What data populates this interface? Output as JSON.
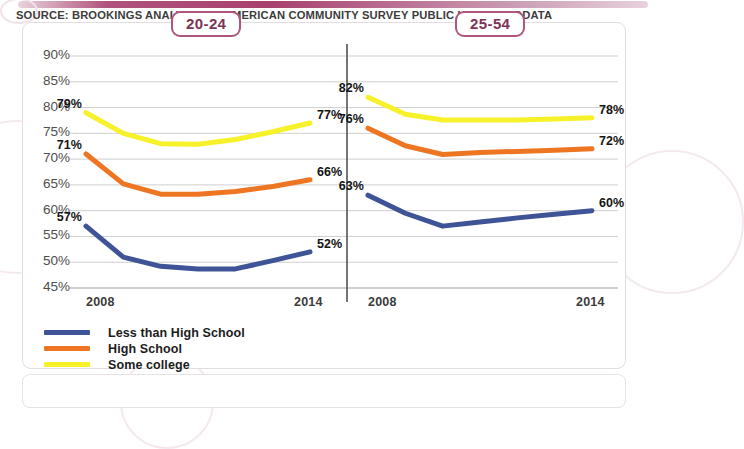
{
  "header": {
    "tabs": [
      {
        "label": "20-24",
        "name": "age-group-20-24"
      },
      {
        "label": "25-54",
        "name": "age-group-25-54"
      }
    ],
    "accent_color": "#b0567e"
  },
  "legend": {
    "position": "bottom-left",
    "items": [
      {
        "label": "Less than High School",
        "color": "#3f5496"
      },
      {
        "label": "High School",
        "color": "#ee7623"
      },
      {
        "label": "Some college",
        "color": "#f7f12a"
      }
    ]
  },
  "footer": {
    "source": "SOURCE: BROOKINGS ANALYSIS OF AMERICAN COMMUNITY SURVEY PUBLIC USE MICRODATA"
  },
  "axis": {
    "y_ticks": [
      "90%",
      "85%",
      "80%",
      "75%",
      "70%",
      "65%",
      "60%",
      "55%",
      "50%",
      "45%"
    ],
    "x_ticks_left": [
      "2008",
      "2014"
    ],
    "x_ticks_right": [
      "2008",
      "2014"
    ]
  },
  "chart_data": {
    "type": "line",
    "title": "",
    "subtitle": "",
    "xlabel": "",
    "ylabel": "",
    "ylim": [
      45,
      90
    ],
    "ytick_values": [
      90,
      85,
      80,
      75,
      70,
      65,
      60,
      55,
      50,
      45
    ],
    "grid": true,
    "legend_position": "bottom-left",
    "x": [
      2008,
      2009,
      2010,
      2011,
      2012,
      2013,
      2014
    ],
    "panels": [
      {
        "name": "20-24",
        "label": "20-24",
        "series": [
          {
            "name": "Some college",
            "color": "#f7f12a",
            "values": [
              79,
              75.0,
              73.0,
              72.9,
              73.8,
              75.3,
              77
            ],
            "start_label": "79%",
            "end_label": "77%"
          },
          {
            "name": "High School",
            "color": "#ee7623",
            "values": [
              71,
              65.2,
              63.2,
              63.2,
              63.7,
              64.7,
              66
            ],
            "start_label": "71%",
            "end_label": "66%"
          },
          {
            "name": "Less than High School",
            "color": "#3f5496",
            "values": [
              57,
              51.0,
              49.2,
              48.7,
              48.7,
              50.3,
              52
            ],
            "start_label": "57%",
            "end_label": "52%"
          }
        ]
      },
      {
        "name": "25-54",
        "label": "25-54",
        "series": [
          {
            "name": "Some college",
            "color": "#f7f12a",
            "values": [
              82,
              78.7,
              77.6,
              77.6,
              77.6,
              77.8,
              78
            ],
            "start_label": "82%",
            "end_label": "78%"
          },
          {
            "name": "High School",
            "color": "#ee7623",
            "values": [
              76,
              72.6,
              70.9,
              71.3,
              71.5,
              71.7,
              72
            ],
            "start_label": "76%",
            "end_label": "72%"
          },
          {
            "name": "Less than High School",
            "color": "#3f5496",
            "values": [
              63,
              59.5,
              57.0,
              57.8,
              58.6,
              59.3,
              60
            ],
            "start_label": "63%",
            "end_label": "60%"
          }
        ]
      }
    ]
  }
}
